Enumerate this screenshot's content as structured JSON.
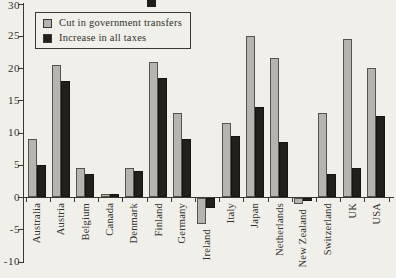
{
  "figure": {
    "background_color": "#f0efea",
    "ink_color": "#3a382f"
  },
  "chart_data": {
    "type": "bar",
    "title": "",
    "xlabel": "",
    "ylabel": "",
    "categories": [
      "Australia",
      "Austria",
      "Belgium",
      "Canada",
      "Denmark",
      "Finland",
      "Germany",
      "Ireland",
      "Italy",
      "Japan",
      "Netherlands",
      "New Zealand",
      "Switzerland",
      "UK",
      "USA"
    ],
    "series": [
      {
        "name": "Cut in government transfers",
        "color": "#b5b4ae",
        "values": [
          9,
          20.5,
          4.5,
          0.5,
          4.5,
          21,
          13,
          -4,
          11.5,
          25,
          21.5,
          -1,
          13,
          24.5,
          20
        ]
      },
      {
        "name": "Increase in all taxes",
        "color": "#21201c",
        "values": [
          5,
          18,
          3.5,
          0.5,
          4,
          18.5,
          9,
          -1.5,
          9.5,
          14,
          8.5,
          -0.5,
          3.5,
          4.5,
          12.5
        ]
      }
    ],
    "ylim": [
      -10,
      30
    ],
    "yticks": [
      30,
      25,
      20,
      15,
      10,
      5,
      0,
      -5,
      -10
    ],
    "grid": false,
    "legend_position": "top-left"
  }
}
